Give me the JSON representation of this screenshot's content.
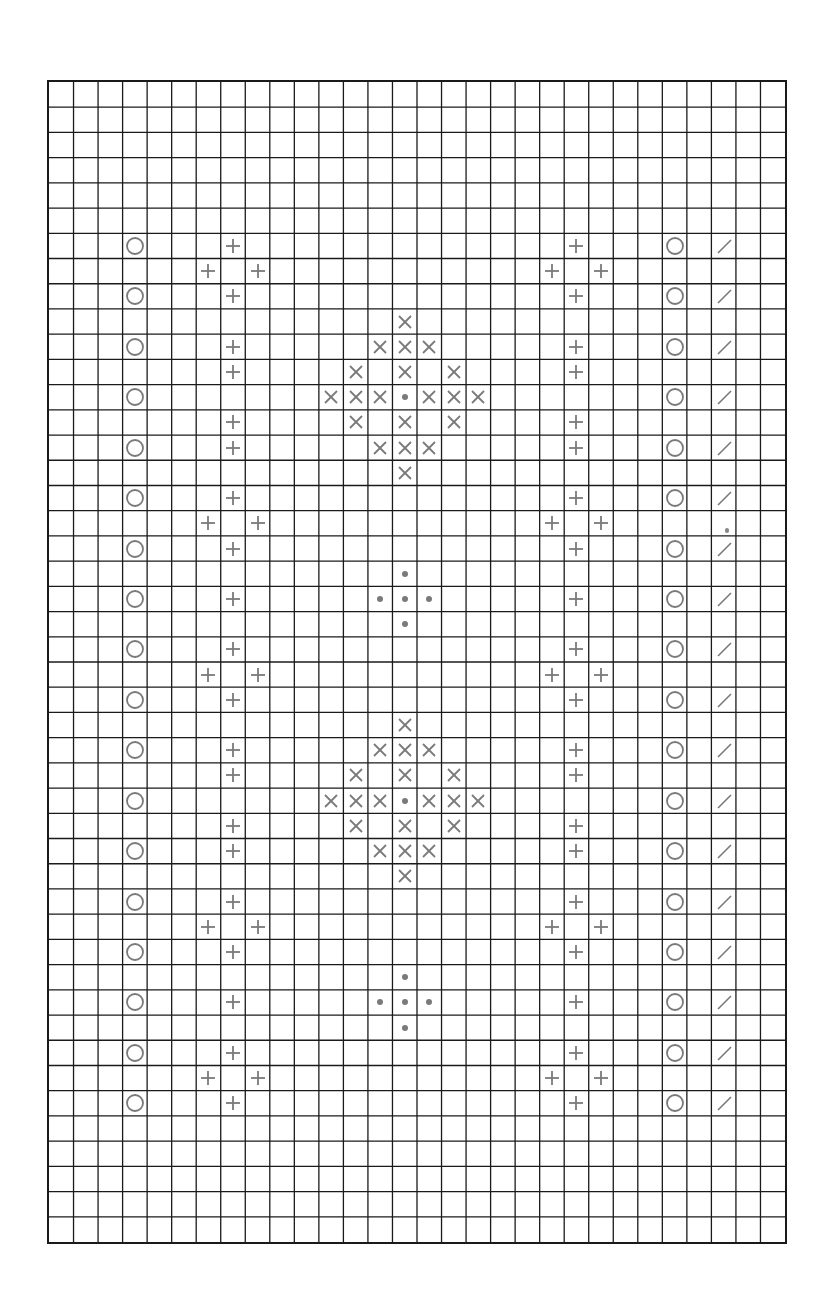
{
  "chart_data": {
    "type": "table",
    "title": "",
    "grid": {
      "columns": 30,
      "rows": 46,
      "line_color": "#1a1a1a",
      "symbol_color": "#7a7a7a"
    },
    "legend": {
      "O": "circle",
      "+": "plus",
      "X": "cross",
      "dot": "dot",
      "/": "slash"
    },
    "symbols": [
      {
        "r": 6,
        "c": 3,
        "s": "O"
      },
      {
        "r": 6,
        "c": 7,
        "s": "+"
      },
      {
        "r": 6,
        "c": 21,
        "s": "+"
      },
      {
        "r": 6,
        "c": 25,
        "s": "O"
      },
      {
        "r": 6,
        "c": 27,
        "s": "/"
      },
      {
        "r": 7,
        "c": 6,
        "s": "+"
      },
      {
        "r": 7,
        "c": 8,
        "s": "+"
      },
      {
        "r": 7,
        "c": 20,
        "s": "+"
      },
      {
        "r": 7,
        "c": 22,
        "s": "+"
      },
      {
        "r": 8,
        "c": 3,
        "s": "O"
      },
      {
        "r": 8,
        "c": 7,
        "s": "+"
      },
      {
        "r": 8,
        "c": 21,
        "s": "+"
      },
      {
        "r": 8,
        "c": 25,
        "s": "O"
      },
      {
        "r": 8,
        "c": 27,
        "s": "/"
      },
      {
        "r": 9,
        "c": 14,
        "s": "X"
      },
      {
        "r": 10,
        "c": 3,
        "s": "O"
      },
      {
        "r": 10,
        "c": 7,
        "s": "+"
      },
      {
        "r": 10,
        "c": 13,
        "s": "X"
      },
      {
        "r": 10,
        "c": 14,
        "s": "X"
      },
      {
        "r": 10,
        "c": 15,
        "s": "X"
      },
      {
        "r": 10,
        "c": 21,
        "s": "+"
      },
      {
        "r": 10,
        "c": 25,
        "s": "O"
      },
      {
        "r": 10,
        "c": 27,
        "s": "/"
      },
      {
        "r": 11,
        "c": 7,
        "s": "+"
      },
      {
        "r": 11,
        "c": 12,
        "s": "X"
      },
      {
        "r": 11,
        "c": 14,
        "s": "X"
      },
      {
        "r": 11,
        "c": 16,
        "s": "X"
      },
      {
        "r": 11,
        "c": 21,
        "s": "+"
      },
      {
        "r": 12,
        "c": 3,
        "s": "O"
      },
      {
        "r": 12,
        "c": 11,
        "s": "X"
      },
      {
        "r": 12,
        "c": 12,
        "s": "X"
      },
      {
        "r": 12,
        "c": 13,
        "s": "X"
      },
      {
        "r": 12,
        "c": 14,
        "s": "dot"
      },
      {
        "r": 12,
        "c": 15,
        "s": "X"
      },
      {
        "r": 12,
        "c": 16,
        "s": "X"
      },
      {
        "r": 12,
        "c": 17,
        "s": "X"
      },
      {
        "r": 12,
        "c": 25,
        "s": "O"
      },
      {
        "r": 12,
        "c": 27,
        "s": "/"
      },
      {
        "r": 13,
        "c": 7,
        "s": "+"
      },
      {
        "r": 13,
        "c": 12,
        "s": "X"
      },
      {
        "r": 13,
        "c": 14,
        "s": "X"
      },
      {
        "r": 13,
        "c": 16,
        "s": "X"
      },
      {
        "r": 13,
        "c": 21,
        "s": "+"
      },
      {
        "r": 14,
        "c": 3,
        "s": "O"
      },
      {
        "r": 14,
        "c": 7,
        "s": "+"
      },
      {
        "r": 14,
        "c": 13,
        "s": "X"
      },
      {
        "r": 14,
        "c": 14,
        "s": "X"
      },
      {
        "r": 14,
        "c": 15,
        "s": "X"
      },
      {
        "r": 14,
        "c": 21,
        "s": "+"
      },
      {
        "r": 14,
        "c": 25,
        "s": "O"
      },
      {
        "r": 14,
        "c": 27,
        "s": "/"
      },
      {
        "r": 15,
        "c": 14,
        "s": "X"
      },
      {
        "r": 16,
        "c": 3,
        "s": "O"
      },
      {
        "r": 16,
        "c": 7,
        "s": "+"
      },
      {
        "r": 16,
        "c": 21,
        "s": "+"
      },
      {
        "r": 16,
        "c": 25,
        "s": "O"
      },
      {
        "r": 16,
        "c": 27,
        "s": "/"
      },
      {
        "r": 17,
        "c": 6,
        "s": "+"
      },
      {
        "r": 17,
        "c": 8,
        "s": "+"
      },
      {
        "r": 17,
        "c": 20,
        "s": "+"
      },
      {
        "r": 17,
        "c": 22,
        "s": "+"
      },
      {
        "r": 18,
        "c": 3,
        "s": "O"
      },
      {
        "r": 18,
        "c": 7,
        "s": "+"
      },
      {
        "r": 18,
        "c": 21,
        "s": "+"
      },
      {
        "r": 18,
        "c": 25,
        "s": "O"
      },
      {
        "r": 18,
        "c": 27,
        "s": "/"
      },
      {
        "r": 19,
        "c": 14,
        "s": "dot"
      },
      {
        "r": 20,
        "c": 3,
        "s": "O"
      },
      {
        "r": 20,
        "c": 7,
        "s": "+"
      },
      {
        "r": 20,
        "c": 13,
        "s": "dot"
      },
      {
        "r": 20,
        "c": 14,
        "s": "dot"
      },
      {
        "r": 20,
        "c": 15,
        "s": "dot"
      },
      {
        "r": 20,
        "c": 21,
        "s": "+"
      },
      {
        "r": 20,
        "c": 25,
        "s": "O"
      },
      {
        "r": 20,
        "c": 27,
        "s": "/"
      },
      {
        "r": 21,
        "c": 14,
        "s": "dot"
      },
      {
        "r": 22,
        "c": 3,
        "s": "O"
      },
      {
        "r": 22,
        "c": 7,
        "s": "+"
      },
      {
        "r": 22,
        "c": 21,
        "s": "+"
      },
      {
        "r": 22,
        "c": 25,
        "s": "O"
      },
      {
        "r": 22,
        "c": 27,
        "s": "/"
      },
      {
        "r": 23,
        "c": 6,
        "s": "+"
      },
      {
        "r": 23,
        "c": 8,
        "s": "+"
      },
      {
        "r": 23,
        "c": 20,
        "s": "+"
      },
      {
        "r": 23,
        "c": 22,
        "s": "+"
      },
      {
        "r": 24,
        "c": 3,
        "s": "O"
      },
      {
        "r": 24,
        "c": 7,
        "s": "+"
      },
      {
        "r": 24,
        "c": 21,
        "s": "+"
      },
      {
        "r": 24,
        "c": 25,
        "s": "O"
      },
      {
        "r": 24,
        "c": 27,
        "s": "/"
      },
      {
        "r": 25,
        "c": 14,
        "s": "X"
      },
      {
        "r": 26,
        "c": 3,
        "s": "O"
      },
      {
        "r": 26,
        "c": 7,
        "s": "+"
      },
      {
        "r": 26,
        "c": 13,
        "s": "X"
      },
      {
        "r": 26,
        "c": 14,
        "s": "X"
      },
      {
        "r": 26,
        "c": 15,
        "s": "X"
      },
      {
        "r": 26,
        "c": 21,
        "s": "+"
      },
      {
        "r": 26,
        "c": 25,
        "s": "O"
      },
      {
        "r": 26,
        "c": 27,
        "s": "/"
      },
      {
        "r": 27,
        "c": 7,
        "s": "+"
      },
      {
        "r": 27,
        "c": 12,
        "s": "X"
      },
      {
        "r": 27,
        "c": 14,
        "s": "X"
      },
      {
        "r": 27,
        "c": 16,
        "s": "X"
      },
      {
        "r": 27,
        "c": 21,
        "s": "+"
      },
      {
        "r": 28,
        "c": 3,
        "s": "O"
      },
      {
        "r": 28,
        "c": 11,
        "s": "X"
      },
      {
        "r": 28,
        "c": 12,
        "s": "X"
      },
      {
        "r": 28,
        "c": 13,
        "s": "X"
      },
      {
        "r": 28,
        "c": 14,
        "s": "dot"
      },
      {
        "r": 28,
        "c": 15,
        "s": "X"
      },
      {
        "r": 28,
        "c": 16,
        "s": "X"
      },
      {
        "r": 28,
        "c": 17,
        "s": "X"
      },
      {
        "r": 28,
        "c": 25,
        "s": "O"
      },
      {
        "r": 28,
        "c": 27,
        "s": "/"
      },
      {
        "r": 29,
        "c": 7,
        "s": "+"
      },
      {
        "r": 29,
        "c": 12,
        "s": "X"
      },
      {
        "r": 29,
        "c": 14,
        "s": "X"
      },
      {
        "r": 29,
        "c": 16,
        "s": "X"
      },
      {
        "r": 29,
        "c": 21,
        "s": "+"
      },
      {
        "r": 30,
        "c": 3,
        "s": "O"
      },
      {
        "r": 30,
        "c": 7,
        "s": "+"
      },
      {
        "r": 30,
        "c": 13,
        "s": "X"
      },
      {
        "r": 30,
        "c": 14,
        "s": "X"
      },
      {
        "r": 30,
        "c": 15,
        "s": "X"
      },
      {
        "r": 30,
        "c": 21,
        "s": "+"
      },
      {
        "r": 30,
        "c": 25,
        "s": "O"
      },
      {
        "r": 30,
        "c": 27,
        "s": "/"
      },
      {
        "r": 31,
        "c": 14,
        "s": "X"
      },
      {
        "r": 32,
        "c": 3,
        "s": "O"
      },
      {
        "r": 32,
        "c": 7,
        "s": "+"
      },
      {
        "r": 32,
        "c": 21,
        "s": "+"
      },
      {
        "r": 32,
        "c": 25,
        "s": "O"
      },
      {
        "r": 32,
        "c": 27,
        "s": "/"
      },
      {
        "r": 33,
        "c": 6,
        "s": "+"
      },
      {
        "r": 33,
        "c": 8,
        "s": "+"
      },
      {
        "r": 33,
        "c": 20,
        "s": "+"
      },
      {
        "r": 33,
        "c": 22,
        "s": "+"
      },
      {
        "r": 34,
        "c": 3,
        "s": "O"
      },
      {
        "r": 34,
        "c": 7,
        "s": "+"
      },
      {
        "r": 34,
        "c": 21,
        "s": "+"
      },
      {
        "r": 34,
        "c": 25,
        "s": "O"
      },
      {
        "r": 34,
        "c": 27,
        "s": "/"
      },
      {
        "r": 35,
        "c": 14,
        "s": "dot"
      },
      {
        "r": 36,
        "c": 3,
        "s": "O"
      },
      {
        "r": 36,
        "c": 7,
        "s": "+"
      },
      {
        "r": 36,
        "c": 13,
        "s": "dot"
      },
      {
        "r": 36,
        "c": 14,
        "s": "dot"
      },
      {
        "r": 36,
        "c": 15,
        "s": "dot"
      },
      {
        "r": 36,
        "c": 21,
        "s": "+"
      },
      {
        "r": 36,
        "c": 25,
        "s": "O"
      },
      {
        "r": 36,
        "c": 27,
        "s": "/"
      },
      {
        "r": 37,
        "c": 14,
        "s": "dot"
      },
      {
        "r": 38,
        "c": 3,
        "s": "O"
      },
      {
        "r": 38,
        "c": 7,
        "s": "+"
      },
      {
        "r": 38,
        "c": 21,
        "s": "+"
      },
      {
        "r": 38,
        "c": 25,
        "s": "O"
      },
      {
        "r": 38,
        "c": 27,
        "s": "/"
      },
      {
        "r": 39,
        "c": 6,
        "s": "+"
      },
      {
        "r": 39,
        "c": 8,
        "s": "+"
      },
      {
        "r": 39,
        "c": 20,
        "s": "+"
      },
      {
        "r": 39,
        "c": 22,
        "s": "+"
      },
      {
        "r": 40,
        "c": 3,
        "s": "O"
      },
      {
        "r": 40,
        "c": 7,
        "s": "+"
      },
      {
        "r": 40,
        "c": 21,
        "s": "+"
      },
      {
        "r": 40,
        "c": 25,
        "s": "O"
      },
      {
        "r": 40,
        "c": 27,
        "s": "/"
      }
    ],
    "artifacts": [
      {
        "r": 17,
        "c": 27
      }
    ]
  }
}
